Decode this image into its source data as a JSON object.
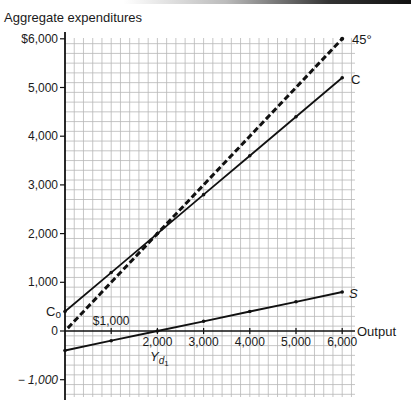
{
  "chart_data": {
    "type": "line",
    "title": "",
    "ylabel": "Aggregate expenditures",
    "xlabel": "Output",
    "x_ticks": [
      {
        "value": 1000,
        "label": "$1,000"
      },
      {
        "value": 2000,
        "label": "2,000"
      },
      {
        "value": 3000,
        "label": "3,000"
      },
      {
        "value": 4000,
        "label": "4,000"
      },
      {
        "value": 5000,
        "label": "5,000"
      },
      {
        "value": 6000,
        "label": "6,000"
      }
    ],
    "y_ticks": [
      {
        "value": 6000,
        "label": "$6,000"
      },
      {
        "value": 5000,
        "label": "5,000"
      },
      {
        "value": 4000,
        "label": "4,000"
      },
      {
        "value": 3000,
        "label": "3,000"
      },
      {
        "value": 2000,
        "label": "2,000"
      },
      {
        "value": 1000,
        "label": "1,000"
      },
      {
        "value": 0,
        "label": "0"
      },
      {
        "value": -1000,
        "label": "− 1,000"
      }
    ],
    "xlim": [
      0,
      6300
    ],
    "ylim": [
      -1350,
      6050
    ],
    "grid": true,
    "x": [
      0,
      1000,
      2000,
      3000,
      4000,
      5000,
      6000
    ],
    "series": [
      {
        "name": "45°",
        "style": "dashed",
        "values": [
          0,
          1000,
          2000,
          3000,
          4000,
          5000,
          6000
        ]
      },
      {
        "name": "C",
        "style": "solid",
        "values": [
          400,
          1200,
          2000,
          2800,
          3600,
          4400,
          5200
        ]
      },
      {
        "name": "S",
        "style": "solid",
        "values": [
          -400,
          -200,
          0,
          200,
          400,
          600,
          800
        ]
      }
    ],
    "annotations": [
      {
        "text": "C",
        "sub": "o",
        "meaning": "consumption intercept",
        "at": [
          0,
          400
        ]
      },
      {
        "text": "Y",
        "sub": "d1",
        "meaning": "break-even disposable income",
        "at": [
          2000,
          0
        ]
      }
    ]
  },
  "labels": {
    "y_axis_title": "Aggregate expenditures",
    "x_axis_title": "Output",
    "line_45": "45°",
    "line_c": "C",
    "line_s": "S",
    "c0_main": "C",
    "c0_sub": "o",
    "yd_main": "Y",
    "yd_sub": "d",
    "yd_subsub": "1"
  }
}
